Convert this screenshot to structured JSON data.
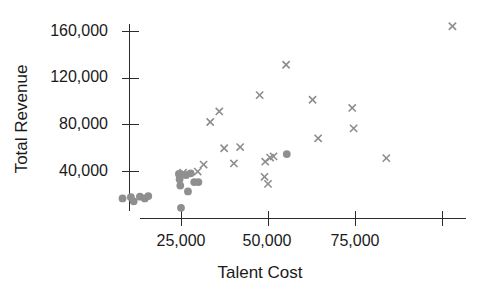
{
  "chart_data": {
    "type": "scatter",
    "title": "",
    "xlabel": "Talent Cost",
    "ylabel": "Total Revenue",
    "xlim": [
      0,
      104000
    ],
    "ylim": [
      0,
      172000
    ],
    "xticks": [
      25000,
      50000,
      75000,
      100000
    ],
    "xtick_labels": [
      "25,000",
      "50,000",
      "75,000",
      ""
    ],
    "yticks": [
      40000,
      80000,
      120000,
      160000
    ],
    "ytick_labels": [
      "40,000",
      "80,000",
      "120,000",
      "160,000"
    ],
    "grid": false,
    "legend": false,
    "legend_position": "none",
    "marker_color": "#8d8d8d",
    "axis_color": "#2b2b2b",
    "series": [
      {
        "name": "series-x",
        "marker": "x",
        "color": "#8d8d8d",
        "points": [
          [
            25600,
            38500
          ],
          [
            26200,
            37000
          ],
          [
            29800,
            39500
          ],
          [
            31500,
            45500
          ],
          [
            33400,
            82000
          ],
          [
            36000,
            91000
          ],
          [
            37400,
            59500
          ],
          [
            40200,
            46500
          ],
          [
            42000,
            60500
          ],
          [
            47600,
            105000
          ],
          [
            49200,
            48000
          ],
          [
            49000,
            35000
          ],
          [
            50000,
            29000
          ],
          [
            50600,
            51500
          ],
          [
            51600,
            52500
          ],
          [
            55200,
            131000
          ],
          [
            62800,
            101000
          ],
          [
            64400,
            68000
          ],
          [
            74200,
            94000
          ],
          [
            74600,
            76500
          ],
          [
            84000,
            51000
          ],
          [
            103000,
            164000
          ]
        ]
      },
      {
        "name": "series-dot",
        "marker": "circle",
        "color": "#8f8f8f",
        "points": [
          [
            8200,
            16500
          ],
          [
            10600,
            17500
          ],
          [
            11400,
            14000
          ],
          [
            13200,
            18000
          ],
          [
            14600,
            16500
          ],
          [
            15600,
            18500
          ],
          [
            24400,
            37500
          ],
          [
            24600,
            33000
          ],
          [
            24800,
            27500
          ],
          [
            25000,
            8500
          ],
          [
            26400,
            36500
          ],
          [
            27000,
            22500
          ],
          [
            27800,
            38000
          ],
          [
            28800,
            30500
          ],
          [
            30000,
            30500
          ],
          [
            55400,
            54500
          ]
        ]
      }
    ]
  },
  "axes": {
    "y_tick_labels": [
      {
        "value": "160,000",
        "y": 31
      },
      {
        "value": "120,000",
        "y": 77
      },
      {
        "value": "80,000",
        "y": 124
      },
      {
        "value": "40,000",
        "y": 171
      }
    ],
    "x_tick_labels": [
      {
        "value": "25,000",
        "x": 181
      },
      {
        "value": "50,000",
        "x": 267
      },
      {
        "value": "75,000",
        "x": 355
      }
    ]
  }
}
